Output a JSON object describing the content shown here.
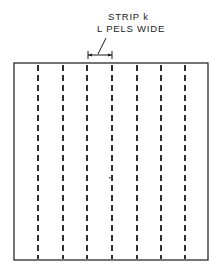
{
  "diagram": {
    "label": {
      "line1": "STRIP k",
      "line2": "L PELS WIDE"
    },
    "frame": {
      "x": 14,
      "y": 63,
      "width": 194,
      "height": 197
    },
    "strip_lines_x": [
      38,
      63,
      87,
      112,
      137,
      161,
      185
    ],
    "dimension": {
      "x1": 88,
      "x2": 112,
      "y": 55
    },
    "colors": {
      "line": "#1a1a1a",
      "background": "#ffffff"
    }
  }
}
